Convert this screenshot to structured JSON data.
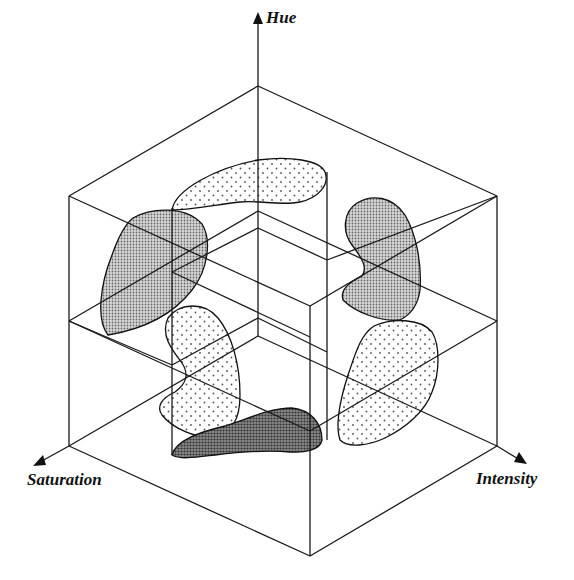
{
  "figure": {
    "type": "3d-color-space-cube",
    "axes": {
      "hue": {
        "label": "Hue",
        "direction": "up"
      },
      "saturation": {
        "label": "Saturation",
        "direction": "down-left"
      },
      "intensity": {
        "label": "Intensity",
        "direction": "down-right"
      }
    },
    "colors": {
      "line": "#1a1a1a",
      "dense_fill": "#9a9a9a",
      "dark_fill": "#6e6e6e",
      "sparse_fill": "#ffffff",
      "dot": "#555555"
    },
    "regions": [
      {
        "name": "top-region",
        "pattern": "sparse-dots"
      },
      {
        "name": "left-upper-region",
        "pattern": "dense-dots"
      },
      {
        "name": "right-upper-region",
        "pattern": "dense-dots"
      },
      {
        "name": "left-lower-region",
        "pattern": "sparse-dots"
      },
      {
        "name": "right-lower-region",
        "pattern": "sparse-dots"
      },
      {
        "name": "bottom-region",
        "pattern": "dark-dense"
      }
    ]
  }
}
